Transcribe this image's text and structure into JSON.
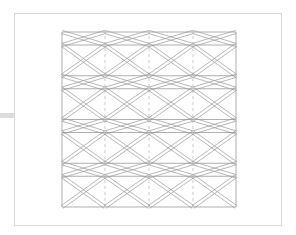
{
  "document": {
    "title": "Truss Elevation Drawing",
    "kind": "technical-line-drawing",
    "background_color": "#ffffff"
  },
  "page_frame": {
    "name": "drawing-sheet-border",
    "x": 14,
    "y": 13,
    "width": 268,
    "height": 213,
    "stroke_color": "#d8d8d8",
    "stroke_width": 1
  },
  "edge_marker": {
    "name": "left-edge-marker",
    "x": 0,
    "y": 113,
    "width": 14,
    "height": 5,
    "color": "#dcdcdc"
  },
  "truss": {
    "name": "lattice-truss-elevation",
    "left": 62,
    "right": 236,
    "top": 32,
    "bottom": 207,
    "panel_count": 4,
    "panel_height": 43.75,
    "chord_color": "#8c8c8c",
    "web_color": "#9a9a9a",
    "double_line_offset": 1.6,
    "stroke_width": 0.7,
    "chord_rows_y": [
      32,
      45,
      75.75,
      88.75,
      119.5,
      132.5,
      163.25,
      176.25,
      207
    ],
    "vertical_edges_x": [
      62,
      236
    ],
    "centerlines": {
      "name": "vertical-centerlines",
      "x_positions": [
        105,
        149,
        193
      ],
      "color": "#c2b0b0",
      "dash": "3 3",
      "stroke_width": 0.7
    },
    "node_x_positions": [
      62,
      105,
      149,
      193,
      236
    ],
    "web_pattern": "alternating-X-and-zigzag-diagonals",
    "description": "Four stacked truss panels, each bounded by a pair of closely spaced horizontal chords, with crossing diagonal web members forming X and diamond shapes between vertical centerlines."
  }
}
